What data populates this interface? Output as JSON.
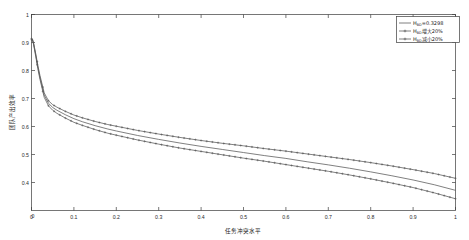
{
  "figure": {
    "background": "#ffffff",
    "axis_color": "#3d3d3d",
    "text_color": "#1a1a1a"
  },
  "chart_data": {
    "type": "line",
    "title": "",
    "xlabel": "任务冲突水平",
    "ylabel": "团队产出效率",
    "xlim": [
      0,
      1
    ],
    "ylim": [
      0.3,
      1.0
    ],
    "grid": false,
    "legend_position": "top-right",
    "x_ticks": [
      0,
      0.1,
      0.2,
      0.3,
      0.4,
      0.5,
      0.6,
      0.7,
      0.8,
      0.9,
      1
    ],
    "x_tick_labels": [
      "0",
      "0.1",
      "0.2",
      "0.3",
      "0.4",
      "0.5",
      "0.6",
      "0.7",
      "0.8",
      "0.9",
      "1"
    ],
    "y_ticks": [
      0.4,
      0.5,
      0.6,
      0.7,
      0.8,
      0.9,
      1.0
    ],
    "y_tick_labels": [
      "0.4",
      "0.5",
      "0.6",
      "0.7",
      "0.8",
      "0.9",
      "1"
    ],
    "y_origin_label": "0",
    "x": [
      0.002,
      0.005,
      0.01,
      0.015,
      0.02,
      0.03,
      0.04,
      0.05,
      0.06,
      0.08,
      0.1,
      0.12,
      0.15,
      0.18,
      0.2,
      0.25,
      0.3,
      0.35,
      0.4,
      0.45,
      0.5,
      0.55,
      0.6,
      0.65,
      0.7,
      0.75,
      0.8,
      0.85,
      0.9,
      0.95,
      1.0
    ],
    "series": [
      {
        "name": "H_BD=0.3298",
        "label_base": "H",
        "label_sub": "BD",
        "label_rest": "=0.3298",
        "color": "#555555",
        "marker": "none",
        "linestyle": "solid",
        "values": [
          0.912,
          0.895,
          0.855,
          0.812,
          0.775,
          0.712,
          0.683,
          0.668,
          0.658,
          0.642,
          0.628,
          0.617,
          0.603,
          0.591,
          0.584,
          0.568,
          0.554,
          0.541,
          0.529,
          0.518,
          0.507,
          0.496,
          0.486,
          0.474,
          0.463,
          0.451,
          0.438,
          0.424,
          0.409,
          0.392,
          0.372
        ]
      },
      {
        "name": "H_BD增大20%",
        "label_base": "H",
        "label_sub": "BD",
        "label_rest": "增大20%",
        "color": "#555555",
        "marker": "cross",
        "linestyle": "solid",
        "values": [
          0.914,
          0.898,
          0.86,
          0.818,
          0.782,
          0.72,
          0.692,
          0.678,
          0.669,
          0.654,
          0.641,
          0.631,
          0.618,
          0.607,
          0.601,
          0.586,
          0.573,
          0.561,
          0.55,
          0.54,
          0.531,
          0.521,
          0.512,
          0.502,
          0.492,
          0.482,
          0.471,
          0.459,
          0.446,
          0.432,
          0.415
        ]
      },
      {
        "name": "H_BD减小20%",
        "label_base": "H",
        "label_sub": "BD",
        "label_rest": "减小20%",
        "color": "#555555",
        "marker": "cross",
        "linestyle": "solid",
        "values": [
          0.91,
          0.892,
          0.85,
          0.806,
          0.768,
          0.704,
          0.674,
          0.658,
          0.647,
          0.63,
          0.615,
          0.604,
          0.589,
          0.576,
          0.569,
          0.552,
          0.537,
          0.523,
          0.511,
          0.499,
          0.487,
          0.476,
          0.464,
          0.452,
          0.44,
          0.427,
          0.413,
          0.398,
          0.382,
          0.363,
          0.342
        ]
      }
    ]
  }
}
